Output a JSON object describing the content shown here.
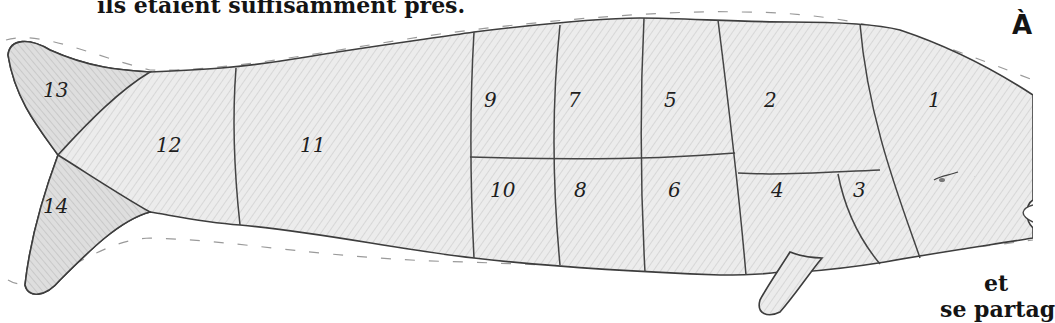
{
  "captions": {
    "top_line": "ils étaient suffisamment près.",
    "right_heading_fragment": "À",
    "bottom_right_line1": "et",
    "bottom_right_line2": "se partag"
  },
  "illustration": {
    "subject": "whale divided into numbered portions",
    "sections": [
      {
        "id": 1,
        "label": "1",
        "x": 933,
        "y": 107
      },
      {
        "id": 2,
        "label": "2",
        "x": 770,
        "y": 107
      },
      {
        "id": 3,
        "label": "3",
        "x": 859,
        "y": 197
      },
      {
        "id": 4,
        "label": "4",
        "x": 777,
        "y": 197
      },
      {
        "id": 5,
        "label": "5",
        "x": 670,
        "y": 107
      },
      {
        "id": 6,
        "label": "6",
        "x": 674,
        "y": 197
      },
      {
        "id": 7,
        "label": "7",
        "x": 574,
        "y": 107
      },
      {
        "id": 8,
        "label": "8",
        "x": 580,
        "y": 197
      },
      {
        "id": 9,
        "label": "9",
        "x": 490,
        "y": 107
      },
      {
        "id": 10,
        "label": "10",
        "x": 502,
        "y": 197
      },
      {
        "id": 11,
        "label": "11",
        "x": 312,
        "y": 152
      },
      {
        "id": 12,
        "label": "12",
        "x": 168,
        "y": 152
      },
      {
        "id": 13,
        "label": "13",
        "x": 55,
        "y": 97
      },
      {
        "id": 14,
        "label": "14",
        "x": 55,
        "y": 213
      }
    ],
    "colors": {
      "outline": "#3d3d3d",
      "fill_light": "#ececec",
      "fill_shade": "#d6d6d6"
    }
  }
}
